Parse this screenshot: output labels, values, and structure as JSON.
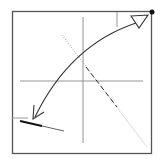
{
  "diagram": {
    "type": "origami-fold-step",
    "colors": {
      "background": "#ffffff",
      "paper_border": "#555555",
      "crease": "#888888",
      "arrow": "#333333",
      "valley_fold": "#999999",
      "dashed_fold": "#333333",
      "dot": "#111111"
    },
    "elements": {
      "paper_square": {
        "x": 12,
        "y": 11,
        "width": 140,
        "height": 143
      },
      "horizontal_crease": {
        "x1": 20,
        "y1": 81,
        "x2": 143,
        "y2": 81
      },
      "vertical_crease": {
        "x1": 83,
        "y1": 17,
        "x2": 83,
        "y2": 143
      },
      "top_right_tick": {
        "x1": 117,
        "y1": 11,
        "x2": 117,
        "y2": 27
      },
      "diagonal_valley_fold": {
        "x1": 62,
        "y1": 35,
        "x2": 147,
        "y2": 147
      },
      "diagonal_dashed_segment": {
        "x1": 86,
        "y1": 67,
        "x2": 117,
        "y2": 107
      },
      "corner_dot": {
        "cx": 152,
        "cy": 12,
        "r": 2.5
      },
      "fold_arrow": {
        "start": [
          140,
          19
        ],
        "end": [
          33,
          119
        ],
        "hollow_head_at": "top-right",
        "open_head_at": "bottom-left"
      },
      "bottom_left_flap": {
        "grey_tick": {
          "x1": 12,
          "y1": 118,
          "x2": 28,
          "y2": 118
        },
        "thick_edge": {
          "x1": 20,
          "y1": 121,
          "x2": 42,
          "y2": 126
        },
        "thin_edge": {
          "x1": 42,
          "y1": 126,
          "x2": 64,
          "y2": 131
        }
      }
    }
  }
}
